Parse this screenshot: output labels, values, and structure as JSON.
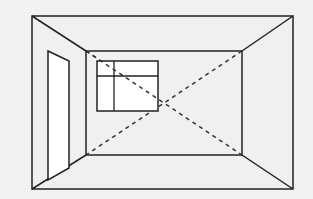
{
  "diagram": {
    "colors": {
      "background": "#f2f2f2",
      "wall": "#f0f0f0",
      "line": "#222222",
      "window_fill": "#ffffff",
      "door_fill": "#ffffff"
    },
    "outer_frame": {
      "x1": 32,
      "y1": 16,
      "x2": 293,
      "y2": 189
    },
    "back_wall": {
      "x1": 86,
      "y1": 51,
      "x2": 242,
      "y2": 155
    },
    "window": {
      "x1": 97,
      "y1": 61,
      "x2": 158,
      "y2": 111,
      "mullion_x": 114,
      "transom_y": 76
    },
    "door": {
      "top_left": [
        48,
        51
      ],
      "top_right": [
        69,
        61
      ],
      "bottom_right": [
        69,
        168
      ],
      "bottom_left": [
        48,
        180
      ]
    },
    "diagonals": "dashed lines connecting opposite back-wall corners"
  }
}
